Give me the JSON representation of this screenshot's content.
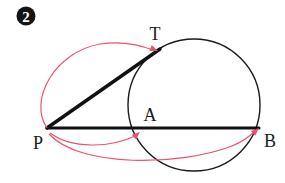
{
  "figure": {
    "badge": {
      "label": "2",
      "circle_fill": "#141414",
      "text_color": "#ffffff",
      "cx": 26,
      "cy": 16,
      "r": 9.5
    },
    "stroke_colors": {
      "circle": "#1a1a1a",
      "line": "#111111",
      "annotation_red": "#e8556b",
      "background": "#ffffff"
    },
    "circle": {
      "name": "main-circle",
      "cx": 194,
      "cy": 105,
      "r": 66,
      "stroke_width": 1.4
    },
    "points": [
      {
        "id": "P",
        "label": "P",
        "x": 47,
        "y": 128,
        "label_x": 33,
        "label_y": 148
      },
      {
        "id": "T",
        "label": "T",
        "x": 157,
        "y": 52,
        "label_x": 155,
        "label_y": 40
      },
      {
        "id": "A",
        "label": "A",
        "x": 140,
        "y": 128,
        "label_x": 145,
        "label_y": 121
      },
      {
        "id": "B",
        "label": "B",
        "x": 258,
        "y": 128,
        "label_x": 264,
        "label_y": 147
      }
    ],
    "segments": [
      {
        "name": "tangent-segment-PT",
        "from": "P",
        "to": "T",
        "x1": 47,
        "y1": 128,
        "x2": 160,
        "y2": 49,
        "stroke_width": 3.4
      },
      {
        "name": "secant-segment-PB",
        "from": "P",
        "to": "B",
        "x1": 47,
        "y1": 128,
        "x2": 259,
        "y2": 128,
        "stroke_width": 3.0
      }
    ],
    "annotation_arcs": [
      {
        "name": "arc-P-to-T",
        "from": "P",
        "to": "T",
        "path": "M 47 128 C 28 100 55 52 100 44 C 120 41 140 45 153 50",
        "arrow_at": {
          "x": 157,
          "y": 51,
          "angle": 22
        }
      },
      {
        "name": "arc-P-to-A",
        "from": "P",
        "to": "A",
        "path": "M 50 133 C 72 149 110 148 135 136",
        "arrow_at": {
          "x": 139,
          "y": 133,
          "angle": -40
        }
      },
      {
        "name": "arc-P-to-B",
        "from": "P",
        "to": "B",
        "path": "M 49 134 C 80 168 180 166 232 146 C 242 142 250 136 255 131",
        "arrow_at": {
          "x": 258,
          "y": 128,
          "angle": -42
        }
      }
    ]
  }
}
